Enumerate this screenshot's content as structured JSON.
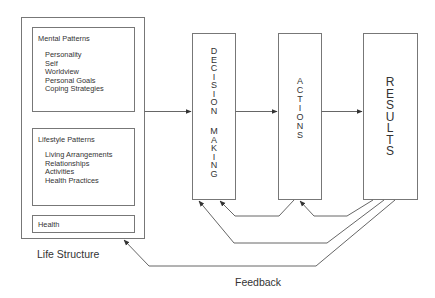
{
  "diagram": {
    "life_structure": {
      "label": "Life Structure",
      "mental_patterns": {
        "title": "Mental Patterns",
        "items": [
          "Personality",
          "Self",
          "Worldview",
          "Personal Goals",
          "Coping Strategies"
        ]
      },
      "lifestyle_patterns": {
        "title": "Lifestyle Patterns",
        "items": [
          "Living Arrangements",
          "Relationships",
          "Activities",
          "Health Practices"
        ]
      },
      "health": {
        "title": "Health"
      }
    },
    "decision_making": {
      "word1": [
        "D",
        "E",
        "C",
        "I",
        "S",
        "I",
        "O",
        "N"
      ],
      "word2": [
        "M",
        "A",
        "K",
        "I",
        "N",
        "G"
      ]
    },
    "actions": {
      "letters": [
        "A",
        "C",
        "T",
        "I",
        "O",
        "N",
        "S"
      ]
    },
    "results": {
      "letters": [
        "R",
        "E",
        "S",
        "U",
        "L",
        "T",
        "S"
      ]
    },
    "feedback_label": "Feedback",
    "colors": {
      "stroke": "#777777",
      "text": "#333333",
      "background": "#ffffff"
    }
  }
}
